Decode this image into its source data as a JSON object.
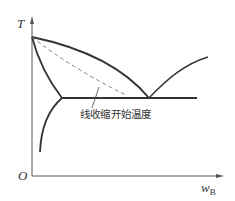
{
  "diagram": {
    "type": "binary eutectic phase diagram",
    "axes": {
      "y_label": "T",
      "x_label_main": "w",
      "x_label_sub": "B",
      "origin_label": "O"
    },
    "annotation": "线收缩开始温度",
    "colors": {
      "line": "#333333",
      "dashed": "#777777",
      "axis": "#555555",
      "background": "#ffffff"
    }
  }
}
